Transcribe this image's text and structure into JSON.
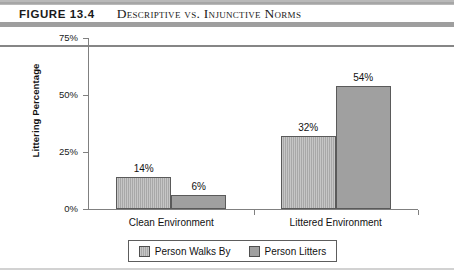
{
  "figure": {
    "number_label": "FIGURE 13.4",
    "title": "Descriptive vs. Injunctive Norms"
  },
  "chart_data": {
    "type": "bar",
    "title": "",
    "xlabel": "",
    "ylabel": "Littering Percentage",
    "categories": [
      "Clean Environment",
      "Littered Environment"
    ],
    "series": [
      {
        "name": "Person Walks By",
        "values": [
          14,
          32
        ],
        "color": "#a8a8a8"
      },
      {
        "name": "Person Litters",
        "values": [
          6,
          54
        ],
        "color": "#a0a0a0"
      }
    ],
    "value_labels": [
      [
        "14%",
        "6%"
      ],
      [
        "32%",
        "54%"
      ]
    ],
    "ylim": [
      0,
      75
    ],
    "yticks": [
      0,
      25,
      50,
      75
    ],
    "ytick_labels": [
      "0%",
      "25%",
      "50%",
      "75%"
    ],
    "grid": false,
    "legend_position": "bottom"
  }
}
